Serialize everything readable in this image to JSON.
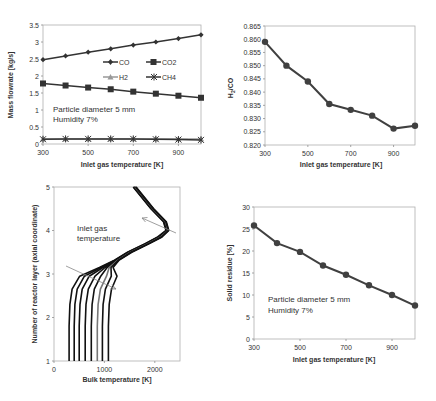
{
  "chart_data": [
    {
      "id": "mass-flowrate",
      "type": "line",
      "title": "",
      "xlabel": "Inlet gas temperature [K]",
      "ylabel": "Mass flowrate [kg/s]",
      "x": [
        300,
        400,
        500,
        600,
        700,
        800,
        900,
        1000
      ],
      "xticks": [
        300,
        500,
        700,
        900
      ],
      "yticks": [
        0,
        0.5,
        1,
        1.5,
        2,
        2.5,
        3,
        3.5
      ],
      "ytick_labels": [
        "0",
        "0.5",
        "1",
        "1.5",
        "2",
        "2.5",
        "3",
        "3.5"
      ],
      "xlim": [
        300,
        1000
      ],
      "ylim": [
        0,
        3.5
      ],
      "grid": false,
      "legend_position": "inside-center",
      "series": [
        {
          "name": "CO",
          "marker": "diamond",
          "color": "#333333",
          "values": [
            2.48,
            2.59,
            2.7,
            2.8,
            2.91,
            3.0,
            3.1,
            3.21
          ]
        },
        {
          "name": "CO2",
          "marker": "square",
          "color": "#333333",
          "values": [
            1.78,
            1.72,
            1.66,
            1.61,
            1.54,
            1.48,
            1.42,
            1.36
          ]
        },
        {
          "name": "H2",
          "marker": "triangle",
          "color": "#999999",
          "values": [
            0.15,
            0.15,
            0.15,
            0.15,
            0.15,
            0.15,
            0.15,
            0.15
          ]
        },
        {
          "name": "CH4",
          "marker": "star",
          "color": "#333333",
          "values": [
            0.14,
            0.15,
            0.15,
            0.15,
            0.15,
            0.14,
            0.13,
            0.12
          ]
        }
      ],
      "annotations": [
        "Particle diameter 5 mm",
        "Humidity 7%"
      ]
    },
    {
      "id": "h2-co-ratio",
      "type": "line",
      "title": "",
      "xlabel": "Inlet gas temperature [K]",
      "ylabel": "H2/CO",
      "x": [
        300,
        400,
        500,
        600,
        700,
        800,
        900,
        1000
      ],
      "xticks": [
        300,
        500,
        700,
        900
      ],
      "yticks": [
        0.82,
        0.825,
        0.83,
        0.835,
        0.84,
        0.845,
        0.85,
        0.855,
        0.86,
        0.865
      ],
      "ytick_labels": [
        "0.820",
        "0.825",
        "0.830",
        "0.835",
        "0.840",
        "0.845",
        "0.850",
        "0.855",
        "0.860",
        "0.865"
      ],
      "xlim": [
        300,
        1000
      ],
      "ylim": [
        0.82,
        0.865
      ],
      "grid": false,
      "series": [
        {
          "name": "H2/CO",
          "marker": "circle",
          "color": "#404040",
          "values": [
            0.859,
            0.85,
            0.844,
            0.8355,
            0.8333,
            0.8311,
            0.8262,
            0.8273
          ]
        }
      ]
    },
    {
      "id": "bulk-temperature-profile",
      "type": "line",
      "title": "",
      "xlabel": "Bulk temperature [K]",
      "ylabel": "Number of reactor layer (axial coordinate)",
      "xticks": [
        0,
        1000,
        2000
      ],
      "yticks": [
        1,
        2,
        3,
        4,
        5
      ],
      "xlim": [
        0,
        2500
      ],
      "ylim": [
        1,
        5
      ],
      "grid": false,
      "series_note": "One curve per inlet gas temperature (300-1000 K); curves converge above layer ~3.5",
      "series": [
        {
          "name": "300 K",
          "bottom_temperature": 300
        },
        {
          "name": "400 K",
          "bottom_temperature": 400
        },
        {
          "name": "500 K",
          "bottom_temperature": 500
        },
        {
          "name": "600 K",
          "bottom_temperature": 620
        },
        {
          "name": "700 K",
          "bottom_temperature": 740
        },
        {
          "name": "800 K",
          "bottom_temperature": 860
        },
        {
          "name": "900 K",
          "bottom_temperature": 960
        },
        {
          "name": "1000 K",
          "bottom_temperature": 1080
        }
      ],
      "shared_upper_profile": {
        "layer": [
          3.5,
          3.7,
          3.85,
          4.0,
          4.2,
          4.5,
          5.0
        ],
        "temperature": [
          1500,
          1850,
          2100,
          2250,
          2200,
          1950,
          1600
        ]
      },
      "annotations": [
        "Inlet gas",
        "temperature"
      ]
    },
    {
      "id": "solid-residue",
      "type": "line",
      "title": "",
      "xlabel": "Inlet gas temperature [K]",
      "ylabel": "Solid residue [%]",
      "x": [
        300,
        400,
        500,
        600,
        700,
        800,
        900,
        1000
      ],
      "xticks": [
        300,
        500,
        700,
        900
      ],
      "yticks": [
        0,
        5,
        10,
        15,
        20,
        25,
        30
      ],
      "ytick_labels": [
        "0",
        "5",
        "10",
        "15",
        "20",
        "25",
        "30"
      ],
      "xlim": [
        300,
        1000
      ],
      "ylim": [
        0,
        30
      ],
      "grid": false,
      "series": [
        {
          "name": "Solid residue",
          "marker": "circle",
          "color": "#404040",
          "values": [
            25.8,
            21.8,
            19.8,
            16.7,
            14.6,
            12.2,
            10.0,
            7.6
          ]
        }
      ],
      "annotations": [
        "Particle diameter 5 mm",
        "Humidity 7%"
      ]
    }
  ],
  "figure": {
    "panels": {
      "top_left": {
        "ylabel": "Mass flowrate [kg/s]",
        "xlabel": "Inlet gas temperature [K]",
        "legend": [
          "CO",
          "CO2",
          "H2",
          "CH4"
        ],
        "note_line1": "Particle diameter 5 mm",
        "note_line2": "Humidity 7%"
      },
      "top_right": {
        "ylabel": "H2/CO",
        "xlabel": "Inlet gas temperature [K]"
      },
      "bottom_left": {
        "ylabel": "Number of reactor layer (axial coordinate)",
        "xlabel": "Bulk temperature [K]",
        "note_line1": "Inlet gas",
        "note_line2": "temperature"
      },
      "bottom_right": {
        "ylabel": "Solid residue [%]",
        "xlabel": "Inlet gas temperature [K]",
        "note_line1": "Particle diameter 5 mm",
        "note_line2": "Humidity 7%"
      }
    }
  }
}
